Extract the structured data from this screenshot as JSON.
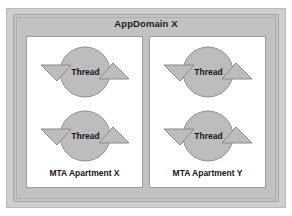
{
  "diagram": {
    "type": "containment-diagram",
    "title": "AppDomain X",
    "colors": {
      "frame_fill": "#c2c2c2",
      "frame_border": "#a8a8a8",
      "panel_fill": "#ffffff",
      "panel_border": "#9c9c9c",
      "shape_fill": "#bdbdbd",
      "shape_stroke": "#8a8a8a",
      "text": "#141414"
    },
    "apartments": [
      {
        "name": "apartment-x",
        "label": "MTA Apartment X",
        "threads": [
          {
            "name": "thread-x-1",
            "label": "Thread",
            "icon": "thread-circle-icon"
          },
          {
            "name": "thread-x-2",
            "label": "Thread",
            "icon": "thread-circle-icon"
          }
        ]
      },
      {
        "name": "apartment-y",
        "label": "MTA Apartment Y",
        "threads": [
          {
            "name": "thread-y-1",
            "label": "Thread",
            "icon": "thread-circle-icon"
          },
          {
            "name": "thread-y-2",
            "label": "Thread",
            "icon": "thread-circle-icon"
          }
        ]
      }
    ]
  }
}
